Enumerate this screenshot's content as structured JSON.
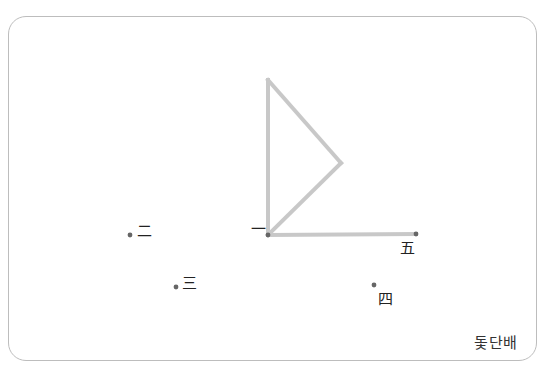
{
  "figure": {
    "caption": "돛단배",
    "line_color": "#c8c8c8",
    "point_color": "#666666",
    "label_color": "#222222",
    "shape": {
      "name": "sailboat",
      "segments": [
        {
          "from": "一",
          "to": "top"
        },
        {
          "from": "top",
          "to": "right"
        },
        {
          "from": "right",
          "to": "一"
        },
        {
          "from": "一",
          "to": "五"
        }
      ],
      "vertices": {
        "top": {
          "x": 268,
          "y": 80
        },
        "right": {
          "x": 341,
          "y": 163
        },
        "一": {
          "x": 268,
          "y": 235
        },
        "五": {
          "x": 416,
          "y": 234
        }
      }
    },
    "points": [
      {
        "id": "一",
        "label": "一",
        "x": 268,
        "y": 235,
        "label_x": 251,
        "label_y": 234
      },
      {
        "id": "二",
        "label": "二",
        "x": 130,
        "y": 235,
        "label_x": 137,
        "label_y": 236
      },
      {
        "id": "三",
        "label": "三",
        "x": 176,
        "y": 287,
        "label_x": 182,
        "label_y": 288
      },
      {
        "id": "四",
        "label": "四",
        "x": 374,
        "y": 285,
        "label_x": 378,
        "label_y": 304
      },
      {
        "id": "五",
        "label": "五",
        "x": 416,
        "y": 234,
        "label_x": 400,
        "label_y": 253
      }
    ]
  }
}
